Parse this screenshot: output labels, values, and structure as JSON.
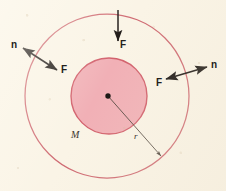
{
  "figure": {
    "name": "gravitational-flux-sphere-diagram",
    "background_color": "#faf4e6",
    "labels": {
      "mass": "M",
      "radius": "r",
      "force_top": "F",
      "force_left": "F",
      "normal_left": "n",
      "force_right": "F",
      "normal_right": "n"
    },
    "geometry": {
      "center": {
        "x": 108,
        "y": 96
      },
      "outer_circle": {
        "cx": 107,
        "cy": 96,
        "r": 82,
        "stroke": "#cf6a72",
        "fill": "none"
      },
      "inner_circle": {
        "cx": 109,
        "cy": 96,
        "r": 38,
        "stroke": "#d2606c",
        "fill": "#f1b0b6"
      },
      "center_dot": {
        "cx": 108,
        "cy": 96,
        "r": 2.6,
        "fill": "#1a1512"
      },
      "radius_line": {
        "x1": 108,
        "y1": 96,
        "x2": 163,
        "y2": 158,
        "stroke": "#4a4038"
      }
    },
    "arrows": [
      {
        "name": "force-top",
        "label": "F",
        "type": "single-headed",
        "from": {
          "x": 118,
          "y": 10
        },
        "to": {
          "x": 118,
          "y": 43
        },
        "label_pos": {
          "x": 121,
          "y": 40
        }
      },
      {
        "name": "normal-force-left",
        "labels": [
          "n",
          "F"
        ],
        "type": "double-headed",
        "from": {
          "x": 20,
          "y": 46
        },
        "to": {
          "x": 59,
          "y": 71
        },
        "label_n_pos": {
          "x": 11,
          "y": 40
        },
        "label_f_pos": {
          "x": 61,
          "y": 66
        }
      },
      {
        "name": "normal-force-right",
        "labels": [
          "F",
          "n"
        ],
        "type": "double-headed",
        "from": {
          "x": 164,
          "y": 79
        },
        "to": {
          "x": 209,
          "y": 66
        },
        "label_f_pos": {
          "x": 157,
          "y": 80
        },
        "label_n_pos": {
          "x": 211,
          "y": 60
        }
      }
    ]
  }
}
